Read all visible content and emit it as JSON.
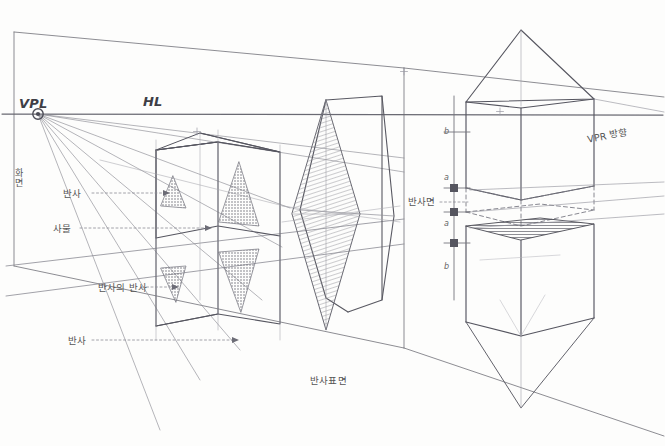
{
  "drawing": {
    "title": "Perspective Reflection Construction Study",
    "medium": "pencil-on-paper",
    "background_color": "#fdfdfc",
    "ink_color": "#5a5a62",
    "hatch_color": "#8d8d95",
    "shade_color": "#6e6e76"
  },
  "labels": {
    "vpl": "VPL",
    "hl": "HL",
    "picture_plane_vertical": "화면",
    "reflection_upper": "반사",
    "object": "사물",
    "reflection_of_reflection": "반사의 반사",
    "reflection_lower": "반사",
    "reflective_surface": "반사표면",
    "reflection_plane_right": "반사면",
    "vpr_direction": "VPR 방향"
  },
  "scale_ticks": [
    {
      "id": "tick-b-upper",
      "label": "b"
    },
    {
      "id": "tick-a-upper",
      "label": "a"
    },
    {
      "id": "tick-a-lower",
      "label": "a"
    },
    {
      "id": "tick-b-lower",
      "label": "b"
    }
  ],
  "figures": {
    "left_block": {
      "name": "stacked-boxes-with-triangles",
      "description": "Upper box holding upright shaded triangles and a mirrored lower box holding inverted triangles"
    },
    "center_lens": {
      "name": "hatched-lens-prism",
      "description": "Vertical hatched lens/diamond form overlapping an open prism outline"
    },
    "right_figure": {
      "name": "cube-with-pyramid-and-mirror",
      "description": "Cube capped by a pyramid above the reflection plane with its mirrored counterpart below and a dark shaded top face"
    }
  },
  "geometry_note": {
    "horizon_y": 113,
    "vpl_point": {
      "x": 38,
      "y": 114
    }
  }
}
